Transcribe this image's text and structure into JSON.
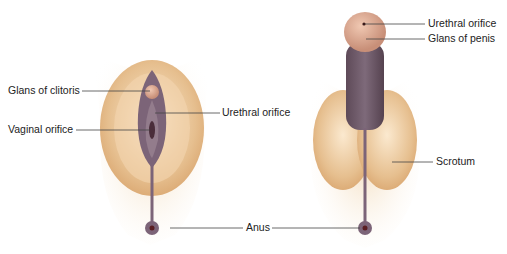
{
  "labels": {
    "glans_clitoris": "Glans of clitoris",
    "vaginal_orifice": "Vaginal orifice",
    "urethral_orifice_f": "Urethral orifice",
    "anus": "Anus",
    "urethral_orifice_m": "Urethral orifice",
    "glans_penis": "Glans of penis",
    "scrotum": "Scrotum"
  },
  "colors": {
    "skin": "#e8c59a",
    "skin_light": "#f6e3c8",
    "mucosa": "#7c6478",
    "glans": "#d9a58e",
    "leader": "#444444"
  }
}
